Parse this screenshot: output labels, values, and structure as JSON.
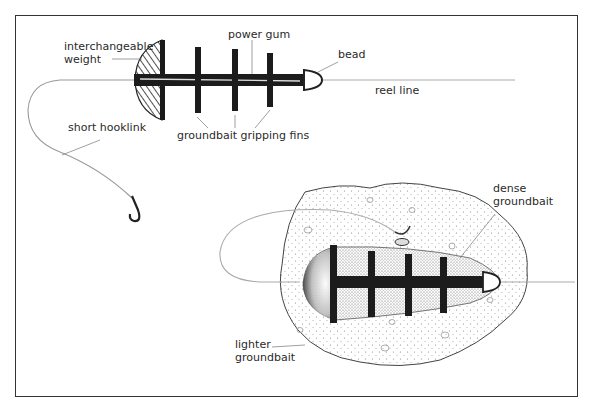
{
  "diagram": {
    "top_figure": {
      "labels": {
        "weight_line1": "interchangeable",
        "weight_line2": "weight",
        "power_gum": "power gum",
        "bead": "bead",
        "reel_line": "reel line",
        "hooklink": "short hooklink",
        "fins": "groundbait gripping fins"
      }
    },
    "bottom_figure": {
      "labels": {
        "dense_line1": "dense",
        "dense_line2": "groundbait",
        "lighter_line1": "lighter",
        "lighter_line2": "groundbait"
      }
    },
    "colors": {
      "ink": "#222222",
      "line": "#9a9a9a",
      "groundbait": "#f3f3f3",
      "frame": "#333333"
    }
  }
}
